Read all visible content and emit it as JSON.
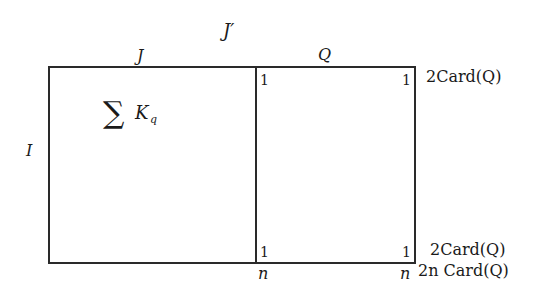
{
  "diagram": {
    "type": "block-matrix",
    "labels": {
      "J_prime": "J′",
      "J": "J",
      "Q": "Q",
      "I": "I",
      "sum_sigma": "∑",
      "sum_K": "K",
      "sum_sub": "q",
      "top_mid_1": "1",
      "top_right_1": "1",
      "bottom_mid_1": "1",
      "bottom_right_1": "1",
      "bottom_mid_n": "n",
      "bottom_right_n": "n",
      "right_top": "2Card(Q)",
      "right_bottom": "2Card(Q)",
      "right_lowest": "2n Card(Q)"
    },
    "regions": [
      {
        "name": "left-block",
        "column_label": "J",
        "content": "∑ K_q"
      },
      {
        "name": "right-block",
        "column_label": "Q",
        "corners": [
          "1",
          "1",
          "1",
          "1"
        ]
      }
    ],
    "row_label": "I"
  }
}
